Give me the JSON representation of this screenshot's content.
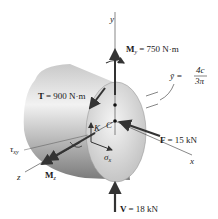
{
  "diagram": {
    "axes": {
      "y": "y",
      "x": "x",
      "z": "z"
    },
    "loads": {
      "My": {
        "sym": "M",
        "sub": "y",
        "value": "= 750 N·m"
      },
      "T": {
        "sym": "T",
        "value": "= 900 N·m"
      },
      "F": {
        "sym": "F",
        "value": "= 15 kN"
      },
      "V": {
        "sym": "V",
        "value": "= 18 kN"
      },
      "Mz": {
        "sym": "M",
        "sub": "z"
      }
    },
    "centroid": {
      "label": "C",
      "ybar_sym": "ȳ =",
      "ybar_num": "4c",
      "ybar_den": "3π"
    },
    "point": {
      "label": "K"
    },
    "stresses": {
      "sigma_x": {
        "sym": "σ",
        "sub": "x"
      },
      "tau_xy": {
        "sym": "τ",
        "sub": "xy"
      }
    },
    "colors": {
      "arrow": "#333333",
      "shaft_light": "#e6e6e6",
      "shaft_dark": "#8c8c8c",
      "face": "#d9d9d9"
    }
  }
}
